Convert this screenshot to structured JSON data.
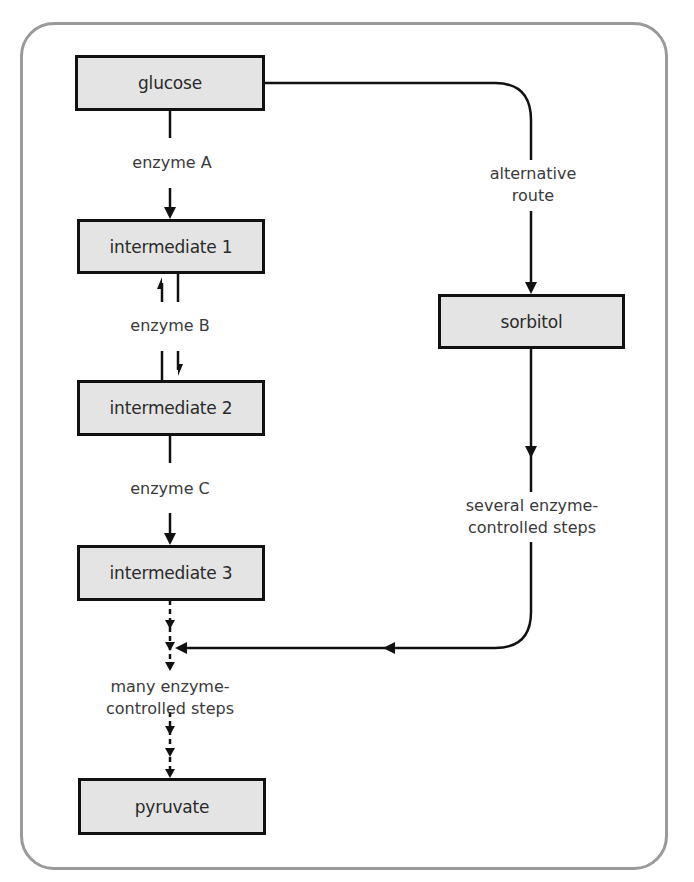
{
  "diagram": {
    "type": "metabolic-pathway-flowchart",
    "nodes": {
      "glucose": "glucose",
      "intermediate_1": "intermediate 1",
      "intermediate_2": "intermediate 2",
      "intermediate_3": "intermediate 3",
      "pyruvate": "pyruvate",
      "sorbitol": "sorbitol"
    },
    "edge_labels": {
      "enzyme_a": "enzyme A",
      "enzyme_b": "enzyme B",
      "enzyme_c": "enzyme C",
      "many_steps_line1": "many enzyme-",
      "many_steps_line2": "controlled steps",
      "alternative_line1": "alternative",
      "alternative_line2": "route",
      "several_steps_line1": "several enzyme-",
      "several_steps_line2": "controlled steps"
    },
    "edges": [
      {
        "from": "glucose",
        "to": "intermediate 1",
        "label": "enzyme A",
        "style": "solid"
      },
      {
        "from": "intermediate 1",
        "to": "intermediate 2",
        "label": "enzyme B",
        "style": "reversible"
      },
      {
        "from": "intermediate 2",
        "to": "intermediate 3",
        "label": "enzyme C",
        "style": "solid"
      },
      {
        "from": "intermediate 3",
        "to": "pyruvate",
        "label": "many enzyme-controlled steps",
        "style": "dashed"
      },
      {
        "from": "glucose",
        "to": "sorbitol",
        "label": "alternative route",
        "style": "solid"
      },
      {
        "from": "sorbitol",
        "to": "many enzyme-controlled steps",
        "label": "several enzyme-controlled steps",
        "style": "solid"
      }
    ],
    "colors": {
      "box_fill": "#e4e4e4",
      "box_border": "#111111",
      "frame_border": "#9a9a9a",
      "text": "#2a2a2a"
    }
  }
}
